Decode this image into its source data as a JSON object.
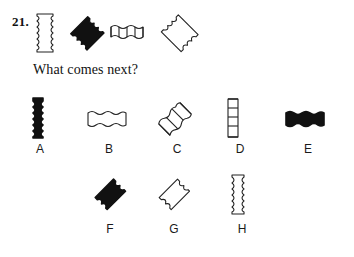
{
  "puzzle": {
    "number": "21.",
    "prompt": "What comes next?",
    "sequence": [
      {
        "id": "seq-1",
        "name": "vertical-outline-wavy-bar",
        "orientation": "vertical",
        "fill": "outline",
        "segments": 0,
        "edge": "wavy"
      },
      {
        "id": "seq-2",
        "name": "diagonal-filled-wavy-bar-up",
        "orientation": "diagonal-up",
        "fill": "solid",
        "segments": 0,
        "edge": "wavy"
      },
      {
        "id": "seq-3",
        "name": "horizontal-outline-segmented-bar",
        "orientation": "horizontal",
        "fill": "outline",
        "segments": 4,
        "edge": "wavy"
      },
      {
        "id": "seq-4",
        "name": "diagonal-outline-wavy-bar-down",
        "orientation": "diagonal-down",
        "fill": "outline",
        "segments": 0,
        "edge": "wavy"
      }
    ],
    "options": [
      {
        "id": "opt-A",
        "label": "A",
        "name": "vertical-filled-wavy-bar",
        "orientation": "vertical",
        "fill": "solid",
        "segments": 0
      },
      {
        "id": "opt-B",
        "label": "B",
        "name": "horizontal-outline-wavy-bar",
        "orientation": "horizontal",
        "fill": "outline",
        "segments": 0
      },
      {
        "id": "opt-C",
        "label": "C",
        "name": "diagonal-outline-segmented-bar-up",
        "orientation": "diagonal-up",
        "fill": "outline",
        "segments": 3
      },
      {
        "id": "opt-D",
        "label": "D",
        "name": "vertical-outline-segmented-bar",
        "orientation": "vertical",
        "fill": "outline",
        "segments": 4
      },
      {
        "id": "opt-E",
        "label": "E",
        "name": "horizontal-filled-wavy-bar",
        "orientation": "horizontal",
        "fill": "solid",
        "segments": 0
      },
      {
        "id": "opt-F",
        "label": "F",
        "name": "diagonal-filled-wavy-bar-up",
        "orientation": "diagonal-up",
        "fill": "solid",
        "segments": 0
      },
      {
        "id": "opt-G",
        "label": "G",
        "name": "diagonal-outline-wavy-bar-up",
        "orientation": "diagonal-up",
        "fill": "outline",
        "segments": 0
      },
      {
        "id": "opt-H",
        "label": "H",
        "name": "vertical-outline-wavy-bar",
        "orientation": "vertical",
        "fill": "outline",
        "segments": 0
      }
    ]
  },
  "colors": {
    "ink": "#111111",
    "paper": "#ffffff",
    "stroke": "#222222"
  }
}
